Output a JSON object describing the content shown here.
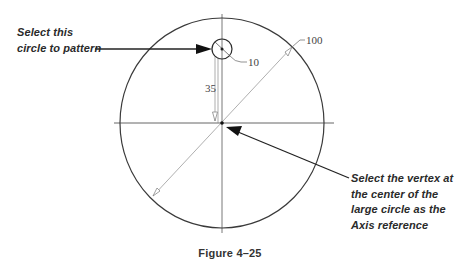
{
  "figure": {
    "caption": "Figure 4–25",
    "callouts": {
      "select_circle": "Select this\ncircle to pattern",
      "select_vertex": "Select the vertex at\nthe center of the\nlarge circle as the\nAxis reference"
    },
    "dimensions": {
      "large_circle_diameter": "100",
      "small_circle_diameter": "10",
      "offset_distance": "35"
    },
    "geometry": {
      "large_circle": {
        "cx": 222,
        "cy": 123,
        "rx": 102,
        "ry": 105
      },
      "small_circle": {
        "cx": 222,
        "cy": 49,
        "r": 10
      },
      "center_vertex": {
        "x": 222,
        "y": 123
      }
    },
    "colors": {
      "geometry_stroke": "#3a3a3a",
      "dimension_stroke": "#8a8a8a",
      "arrow": "#222222",
      "text": "#2a2a2a"
    }
  }
}
